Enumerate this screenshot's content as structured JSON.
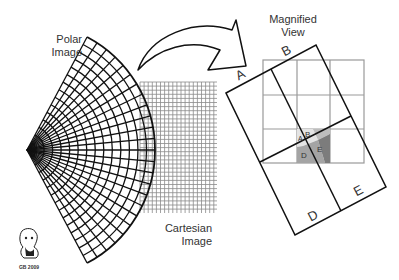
{
  "labels": {
    "polar_line1": "Polar",
    "polar_line2": "Image",
    "magnified_line1": "Magnified",
    "magnified_line2": "View",
    "cartesian_line1": "Cartesian",
    "cartesian_line2": "Image",
    "corner_A": "A",
    "corner_B": "B",
    "corner_D": "D",
    "corner_E": "E",
    "inner_A": "A",
    "inner_B": "B",
    "inner_D": "D",
    "inner_E": "E",
    "signature": "GB 2009"
  },
  "colors": {
    "line": "#111111",
    "grid": "#888888",
    "shade_A": "#e6e6e6",
    "shade_B": "#bcbcbc",
    "shade_D": "#a0a0a0",
    "shade_E": "#7a7a7a"
  }
}
